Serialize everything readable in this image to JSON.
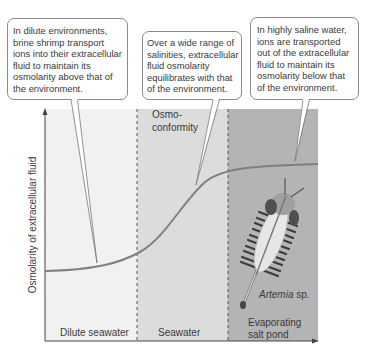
{
  "figure": {
    "callouts": [
      {
        "text": "In dilute environments,\nbrine shrimp transport\nions into their extracellular\nfluid to maintain its\nosmolarity above that of\nthe environment."
      },
      {
        "text": "Over a wide range of\nsalinities, extracellular\nfluid osmolarity\nequilibrates with that\nof the environment."
      },
      {
        "text": "In highly saline water,\nions are transported\nout of the extracellular\nfluid to maintain its\nosmolarity below that\nof the environment."
      }
    ],
    "y_axis_label": "Osmolarity of extracellular fluid",
    "regions": [
      {
        "label": "Dilute seawater",
        "color": "#f1f1f1"
      },
      {
        "label": "Seawater",
        "color": "#dcdcdc"
      },
      {
        "label": "Evaporating\nsalt pond",
        "color": "#b4b4b4"
      }
    ],
    "osmoconformity_label": "Osmo-\nconformity",
    "species_label": {
      "genus": "Artemia",
      "suffix": " sp."
    },
    "colors": {
      "curve": "#808080",
      "axis": "#444444",
      "callout_border": "#8a8a8a"
    }
  }
}
